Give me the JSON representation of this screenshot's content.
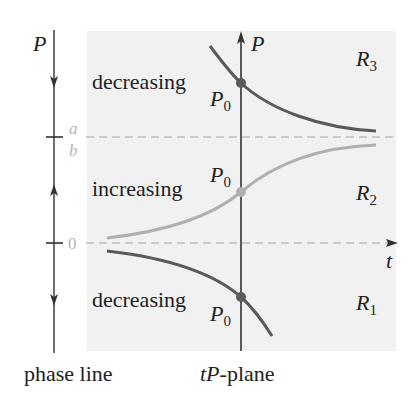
{
  "figure": {
    "phase_line": {
      "axis_label": "P",
      "caption": "phase line",
      "equilibria": [
        {
          "label_top": "a",
          "label_bottom": "b",
          "value": "a/b"
        },
        {
          "label": "0",
          "value": "0"
        }
      ],
      "arrows": [
        "down",
        "up",
        "down"
      ]
    },
    "tp_plane": {
      "caption_italic": "tP",
      "caption_rest": "-plane",
      "vertical_axis_label": "P",
      "horizontal_axis_label": "t",
      "regions": [
        {
          "name": "R",
          "sub": "3",
          "behavior": "decreasing",
          "initial": "P",
          "initial_sub": "0"
        },
        {
          "name": "R",
          "sub": "2",
          "behavior": "increasing",
          "initial": "P",
          "initial_sub": "0"
        },
        {
          "name": "R",
          "sub": "1",
          "behavior": "decreasing",
          "initial": "P",
          "initial_sub": "0"
        }
      ]
    },
    "colors": {
      "background_shade": "#f1f1f1",
      "axis": "#333333",
      "dark_curve": "#5a5a5a",
      "light_curve": "#b0b0b0",
      "dashed": "#bdbdbd"
    }
  }
}
